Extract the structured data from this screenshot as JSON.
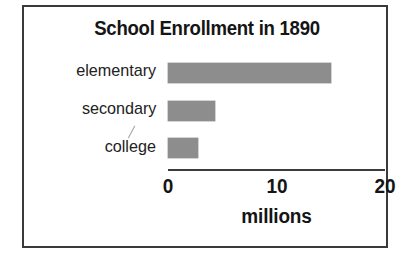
{
  "figure": {
    "border_color": "#3a3a3a",
    "background": "#ffffff",
    "annotation_marks": [
      {
        "name": "pencil-stroke",
        "near": "secondary"
      }
    ]
  },
  "chart_data": {
    "type": "bar",
    "orientation": "horizontal",
    "title": "School Enrollment in 1890",
    "categories": [
      "elementary",
      "secondary",
      "college"
    ],
    "values": [
      15.0,
      4.3,
      2.8
    ],
    "xlabel": "millions",
    "ylabel": "",
    "xlim": [
      0,
      20
    ],
    "xticks": [
      0,
      10,
      20
    ],
    "xtick_labels": [
      "0",
      "10",
      "20"
    ],
    "grid": false,
    "legend": null,
    "bar_color": "#8d8d8d",
    "axis_color": "#3c3c3c",
    "title_color": "#151515",
    "label_color": "#222222"
  },
  "labels": {
    "row0": "elementary",
    "row1": "secondary",
    "row2": "college"
  },
  "ticks": {
    "t0": "0",
    "t1": "10",
    "t2": "20"
  },
  "caption": "millions"
}
